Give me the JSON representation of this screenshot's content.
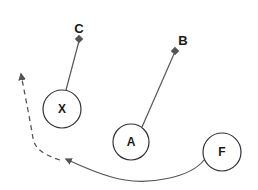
{
  "diagram": {
    "colors": {
      "stroke": "#555555",
      "node_stroke": "#333333",
      "text": "#1a1a1a",
      "background": "#ffffff"
    },
    "nodes": [
      {
        "id": "X",
        "label": "X",
        "cx": 62,
        "cy": 109,
        "r": 19
      },
      {
        "id": "A",
        "label": "A",
        "cx": 131,
        "cy": 142,
        "r": 18
      },
      {
        "id": "F",
        "label": "F",
        "cx": 222,
        "cy": 152,
        "r": 19
      }
    ],
    "endpoints": [
      {
        "id": "C",
        "label": "C",
        "label_x": 79,
        "label_y": 33,
        "marker_x": 79,
        "marker_y": 39
      },
      {
        "id": "B",
        "label": "B",
        "label_x": 183,
        "label_y": 45,
        "marker_x": 175,
        "marker_y": 51
      }
    ],
    "edges": [
      {
        "from": "X",
        "to": "C",
        "style": "solid",
        "marker": "diamond"
      },
      {
        "from": "A",
        "to": "B",
        "style": "solid",
        "marker": "diamond"
      },
      {
        "from": "F",
        "to": "point",
        "style": "solid",
        "marker": "arrow"
      },
      {
        "from": "point",
        "to": "open",
        "style": "dashed",
        "marker": "arrow"
      }
    ]
  }
}
